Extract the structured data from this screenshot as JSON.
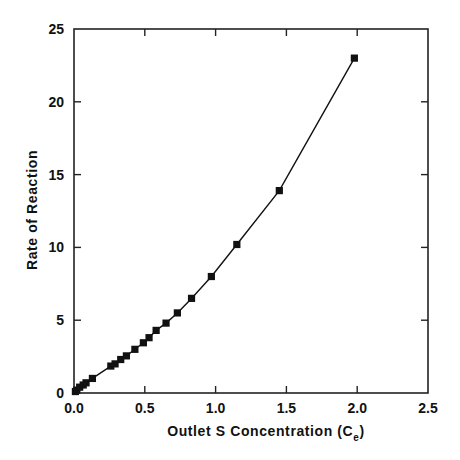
{
  "chart_data": {
    "type": "line",
    "title": "",
    "xlabel": "Outlet S Concentration (C",
    "xlabel_subscript": "e",
    "xlabel_close": ")",
    "ylabel": "Rate of Reaction",
    "xlim": [
      0,
      2.5
    ],
    "ylim": [
      0,
      25
    ],
    "x_ticks": [
      0.0,
      0.5,
      1.0,
      1.5,
      2.0,
      2.5
    ],
    "x_tick_labels": [
      "0.0",
      "0.5",
      "1.0",
      "1.5",
      "2.0",
      "2.5"
    ],
    "y_ticks": [
      0,
      5,
      10,
      15,
      20,
      25
    ],
    "y_tick_labels": [
      "0",
      "5",
      "10",
      "15",
      "20",
      "25"
    ],
    "grid": false,
    "legend": null,
    "marker": "square",
    "series": [
      {
        "name": "Rate of Reaction",
        "color": "#111111",
        "x": [
          0.01,
          0.02,
          0.04,
          0.065,
          0.085,
          0.13,
          0.26,
          0.29,
          0.33,
          0.37,
          0.43,
          0.49,
          0.53,
          0.58,
          0.65,
          0.73,
          0.83,
          0.97,
          1.15,
          1.45,
          1.98
        ],
        "y": [
          0.1,
          0.2,
          0.4,
          0.55,
          0.7,
          1.0,
          1.85,
          2.0,
          2.3,
          2.55,
          3.0,
          3.45,
          3.8,
          4.3,
          4.8,
          5.5,
          6.5,
          8.0,
          10.2,
          13.9,
          23.0
        ]
      }
    ]
  }
}
